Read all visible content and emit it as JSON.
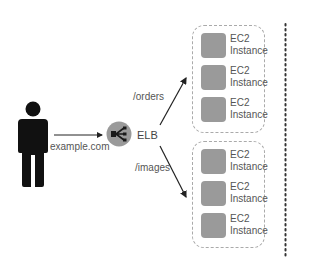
{
  "diagram": {
    "client": {
      "icon": "person-icon",
      "domain_label": "example.com"
    },
    "load_balancer": {
      "icon": "elb-icon",
      "label": "ELB"
    },
    "routes": [
      {
        "path": "/orders",
        "instances": [
          {
            "line1": "EC2",
            "line2": "Instance"
          },
          {
            "line1": "EC2",
            "line2": "Instance"
          },
          {
            "line1": "EC2",
            "line2": "Instance"
          }
        ]
      },
      {
        "path": "/images",
        "instances": [
          {
            "line1": "EC2",
            "line2": "Instance"
          },
          {
            "line1": "EC2",
            "line2": "Instance"
          },
          {
            "line1": "EC2",
            "line2": "Instance"
          }
        ]
      }
    ],
    "colors": {
      "person": "#111111",
      "elb_circle": "#9a9a9a",
      "instance_fill": "#9a9a9a",
      "group_border": "#aaaaaa",
      "arrow": "#222222",
      "dotted_line": "#333333"
    }
  }
}
